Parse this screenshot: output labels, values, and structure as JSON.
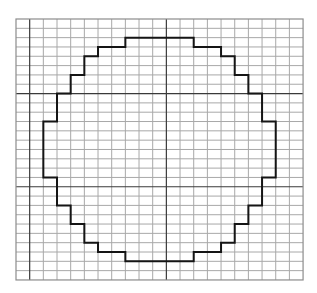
{
  "diagram": {
    "type": "pixelated-circle-on-grid",
    "colors": {
      "background": "#ffffff",
      "grid_line": "#a8a8a8",
      "grid_major_line": "#3a3a3a",
      "border": "#8c8c8c",
      "outline": "#151515"
    },
    "grid": {
      "origin_x": 16,
      "origin_y": 19,
      "columns": 21,
      "rows": 28,
      "cell_width": 13.67,
      "cell_height": 9.32,
      "major_columns": [
        1,
        11
      ],
      "major_rows": [
        8,
        18
      ]
    },
    "outline": {
      "description": "Stair-stepped rasterized circle outline drawn along grid lines",
      "stroke_width": 2,
      "vertices": [
        [
          8,
          2
        ],
        [
          13,
          2
        ],
        [
          13,
          3
        ],
        [
          15,
          3
        ],
        [
          15,
          4
        ],
        [
          16,
          4
        ],
        [
          16,
          6
        ],
        [
          17,
          6
        ],
        [
          17,
          8
        ],
        [
          18,
          8
        ],
        [
          18,
          11
        ],
        [
          19,
          11
        ],
        [
          19,
          17
        ],
        [
          18,
          17
        ],
        [
          18,
          20
        ],
        [
          17,
          20
        ],
        [
          17,
          22
        ],
        [
          16,
          22
        ],
        [
          16,
          24
        ],
        [
          15,
          24
        ],
        [
          15,
          25
        ],
        [
          13,
          25
        ],
        [
          13,
          26
        ],
        [
          8,
          26
        ],
        [
          8,
          25
        ],
        [
          6,
          25
        ],
        [
          6,
          24
        ],
        [
          5,
          24
        ],
        [
          5,
          22
        ],
        [
          4,
          22
        ],
        [
          4,
          20
        ],
        [
          3,
          20
        ],
        [
          3,
          17
        ],
        [
          2,
          17
        ],
        [
          2,
          11
        ],
        [
          3,
          11
        ],
        [
          3,
          8
        ],
        [
          4,
          8
        ],
        [
          4,
          6
        ],
        [
          5,
          6
        ],
        [
          5,
          4
        ],
        [
          6,
          4
        ],
        [
          6,
          3
        ],
        [
          8,
          3
        ]
      ]
    }
  }
}
